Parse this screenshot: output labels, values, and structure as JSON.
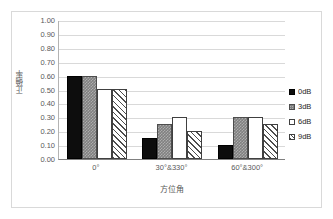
{
  "chart_data": {
    "type": "bar",
    "title": "",
    "xlabel": "方位角",
    "ylabel": "正确率",
    "categories": [
      "0°",
      "30°&330°",
      "60°&300°"
    ],
    "series": [
      {
        "name": "0dB",
        "values": [
          0.6,
          0.15,
          0.1
        ],
        "swatch": "solid-black",
        "color": "#0d0d0d"
      },
      {
        "name": "3dB",
        "values": [
          0.6,
          0.25,
          0.3
        ],
        "swatch": "gray-checkered",
        "color": "#808080"
      },
      {
        "name": "6dB",
        "values": [
          0.5,
          0.3,
          0.3
        ],
        "swatch": "white-empty",
        "color": "#ffffff"
      },
      {
        "name": "9dB",
        "values": [
          0.5,
          0.2,
          0.25
        ],
        "swatch": "diagonal-hatch",
        "color": "#ffffff"
      }
    ],
    "ylim": [
      0.0,
      1.0
    ],
    "ytick_step": 0.1,
    "ytick_labels": [
      "1.00",
      "0.90",
      "0.80",
      "0.70",
      "0.60",
      "0.50",
      "0.40",
      "0.30",
      "0.20",
      "0.10",
      "0.00"
    ],
    "grid": true,
    "legend_position": "right",
    "axis_color": "#808080",
    "grid_color": "#d9d9d9",
    "border_color": "#d9d9d9"
  }
}
